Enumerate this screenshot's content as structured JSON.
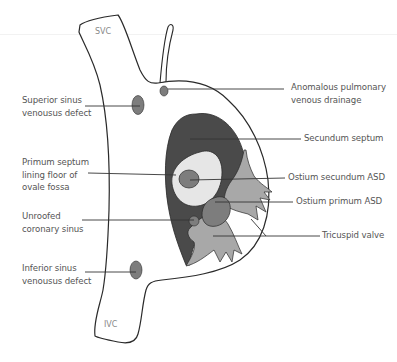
{
  "diagram": {
    "vessel_labels": {
      "svc": "SVC",
      "ivc": "IVC"
    },
    "left_labels": [
      {
        "id": "superior-sinus-venosus-defect",
        "lines": [
          "Superior sinus",
          "venousus defect"
        ]
      },
      {
        "id": "primum-septum-lining-floor",
        "lines": [
          "Primum septum",
          "lining floor of",
          "ovale fossa"
        ]
      },
      {
        "id": "unroofed-coronary-sinus",
        "lines": [
          "Unroofed",
          "coronary sinus"
        ]
      },
      {
        "id": "inferior-sinus-venosus-defect",
        "lines": [
          "Inferior sinus",
          "venousus defect"
        ]
      }
    ],
    "right_labels": [
      {
        "id": "anomalous-pulmonary-venous-drainage",
        "lines": [
          "Anomalous pulmonary",
          "venous drainage"
        ]
      },
      {
        "id": "secundum-septum",
        "lines": [
          "Secundum septum"
        ]
      },
      {
        "id": "ostium-secundum-asd",
        "lines": [
          "Ostium secundum ASD"
        ]
      },
      {
        "id": "ostium-primum-asd",
        "lines": [
          "Ostium primum ASD"
        ]
      },
      {
        "id": "tricuspid-valve",
        "lines": [
          "Tricuspid valve"
        ]
      }
    ],
    "colors": {
      "outline": "#2a2a2a",
      "secundum_septum": "#4a4a4a",
      "fossa_floor": "#e6e6e6",
      "defect": "#7d7d7d",
      "tricuspid": "#a8a8a8",
      "leader_line": "#333333",
      "label_text": "#555555"
    }
  }
}
